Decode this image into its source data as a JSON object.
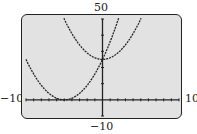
{
  "window": {
    "ymax_label": "50",
    "ymin_label": "−10",
    "xmin_label": "−10",
    "xmax_label": "10"
  },
  "chart_data": {
    "type": "line",
    "title": "",
    "xlabel": "",
    "ylabel": "",
    "xlim": [
      -10,
      10
    ],
    "ylim": [
      -10,
      50
    ],
    "xscale": 1,
    "yscale": 10,
    "grid": false,
    "series": [
      {
        "name": "y = x^2 + 25",
        "x": [
          -5,
          -4,
          -3,
          -2,
          -1,
          0,
          1,
          2,
          3,
          4,
          5
        ],
        "values": [
          50,
          41,
          34,
          29,
          26,
          25,
          26,
          29,
          34,
          41,
          50
        ]
      },
      {
        "name": "y = (x + 5)^2",
        "x": [
          -10,
          -9,
          -8,
          -7,
          -6,
          -5,
          -4,
          -3,
          -2,
          -1,
          0,
          1,
          2,
          2.07
        ],
        "values": [
          25,
          16,
          9,
          4,
          1,
          0,
          1,
          4,
          9,
          16,
          25,
          36,
          49,
          50
        ]
      }
    ]
  },
  "colors": {
    "screen": "#e2e2e2",
    "curve": "#222222"
  }
}
